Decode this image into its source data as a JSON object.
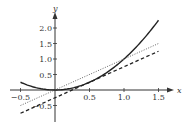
{
  "chart_data": {
    "type": "line",
    "title": "",
    "xlabel": "x",
    "ylabel": "y",
    "xlim": [
      -0.5,
      1.5
    ],
    "ylim": [
      -0.75,
      2.25
    ],
    "grid": false,
    "legend": null,
    "x_ticks": [
      -0.5,
      0.5,
      1.0,
      1.5
    ],
    "x_tick_labels": [
      "−0.5",
      "0.5",
      "1.0",
      "1.5"
    ],
    "y_ticks": [
      -0.5,
      0.5,
      1.0,
      1.5,
      2.0
    ],
    "y_tick_labels": [
      "−0.5",
      "0.5",
      "1.0",
      "1.5",
      "2.0"
    ],
    "series": [
      {
        "name": "y = x^2",
        "style": "solid",
        "x": [
          -0.5,
          -0.25,
          0,
          0.25,
          0.5,
          0.75,
          1.0,
          1.25,
          1.5
        ],
        "y": [
          0.25,
          0.0625,
          0,
          0.0625,
          0.25,
          0.5625,
          1.0,
          1.5625,
          2.25
        ]
      },
      {
        "name": "y = x",
        "style": "dotted",
        "x": [
          -0.5,
          1.5
        ],
        "y": [
          -0.5,
          1.5
        ]
      },
      {
        "name": "y = x - 0.25",
        "style": "dashed",
        "x": [
          -0.5,
          1.5
        ],
        "y": [
          -0.75,
          1.25
        ]
      }
    ]
  },
  "colors": {
    "axis": "#333333",
    "curve": "#222222",
    "dotted_line": "#666666",
    "dashed_line": "#222222"
  }
}
